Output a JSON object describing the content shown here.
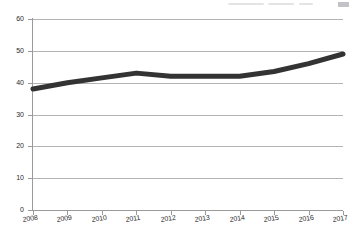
{
  "chart_data": {
    "type": "line",
    "title": "",
    "subtitle": "",
    "xlabel": "",
    "ylabel": "",
    "categories": [
      "2008",
      "2009",
      "2010",
      "2011",
      "2012",
      "2013",
      "2014",
      "2015",
      "2016",
      "2017"
    ],
    "values": [
      38,
      40,
      41.5,
      43,
      42,
      42,
      42,
      43.5,
      46,
      49
    ],
    "series": [
      {
        "name": "",
        "values": [
          38,
          40,
          41.5,
          43,
          42,
          42,
          42,
          43.5,
          46,
          49
        ]
      }
    ],
    "ylim": [
      0,
      60
    ],
    "yticks": [
      0,
      10,
      20,
      30,
      40,
      50,
      60
    ],
    "ytick_labels": [
      "0",
      "10",
      "20",
      "30",
      "40",
      "50",
      "60"
    ],
    "xtick_labels": [
      "2008",
      "2009",
      "2010",
      "2011",
      "2012",
      "2013",
      "2014",
      "2015",
      "2016",
      "2017"
    ],
    "grid": true,
    "grid_axis": "y",
    "legend": false,
    "legend_position": "none",
    "line_color": "#333333",
    "grid_color": "#b4b4b4",
    "axis_color": "#9a9a9a",
    "tick_label_color": "#2b2b2b",
    "line_width": 5,
    "markers": false,
    "annotations": []
  },
  "page": {
    "header_artifact": ""
  }
}
